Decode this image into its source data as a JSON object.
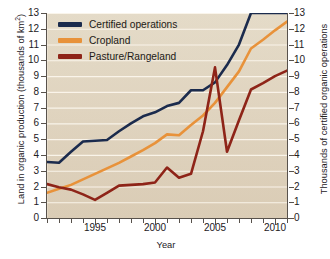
{
  "chart_data": {
    "type": "line",
    "title": "",
    "xlabel": "Year",
    "ylabel_left": "Land in organic production (thousands of km²)",
    "ylabel_right": "Thousands of certified organic operations",
    "xlim": [
      1991,
      2011
    ],
    "ylim": [
      0,
      13
    ],
    "xticks": [
      1995,
      2000,
      2005,
      2010
    ],
    "xtick_labels": [
      "1995",
      "2000",
      "2005",
      "2010"
    ],
    "yticks": [
      0,
      1,
      2,
      3,
      4,
      5,
      6,
      7,
      8,
      9,
      10,
      11,
      12,
      13
    ],
    "ytick_labels": [
      "0",
      "1",
      "2",
      "3",
      "4",
      "5",
      "6",
      "7",
      "8",
      "9",
      "10",
      "11",
      "12",
      "13"
    ],
    "grid": "horizontal-white",
    "legend_position": "top-left",
    "x": [
      1991,
      1992,
      1993,
      1994,
      1995,
      1996,
      1997,
      1998,
      1999,
      2000,
      2001,
      2002,
      2003,
      2004,
      2005,
      2006,
      2007,
      2008,
      2009,
      2010,
      2011
    ],
    "series": [
      {
        "name": "Certified operations",
        "color": "#1b2b4d",
        "axis": "right",
        "values": [
          3.55,
          3.5,
          4.2,
          4.85,
          4.9,
          4.95,
          5.5,
          6.0,
          6.45,
          6.7,
          7.1,
          7.3,
          8.1,
          8.1,
          8.6,
          9.7,
          11.0,
          13.0,
          13.0,
          13.0,
          13.0
        ]
      },
      {
        "name": "Cropland",
        "color": "#e8923a",
        "axis": "left",
        "values": [
          1.6,
          1.85,
          2.1,
          2.45,
          2.8,
          3.15,
          3.5,
          3.9,
          4.3,
          4.75,
          5.3,
          5.25,
          5.9,
          6.5,
          7.3,
          8.3,
          9.3,
          10.75,
          11.3,
          11.9,
          12.45
        ]
      },
      {
        "name": "Pasture/Rangeland",
        "color": "#8e2418",
        "axis": "left",
        "values": [
          2.15,
          1.95,
          1.8,
          1.5,
          1.15,
          1.6,
          2.05,
          2.1,
          2.15,
          2.25,
          3.2,
          2.55,
          2.8,
          5.5,
          9.55,
          4.2,
          6.2,
          8.15,
          8.55,
          9.0,
          9.35
        ]
      }
    ]
  },
  "legend": {
    "items": [
      {
        "label": "Certified operations",
        "color": "#1b2b4d"
      },
      {
        "label": "Cropland",
        "color": "#e8923a"
      },
      {
        "label": "Pasture/Rangeland",
        "color": "#8e2418"
      }
    ]
  },
  "axis_titles": {
    "left_pre": "Land in organic production (thousands of km",
    "left_sup": "2",
    "left_post": ")",
    "right": "Thousands of certified organic operations",
    "x": "Year"
  }
}
